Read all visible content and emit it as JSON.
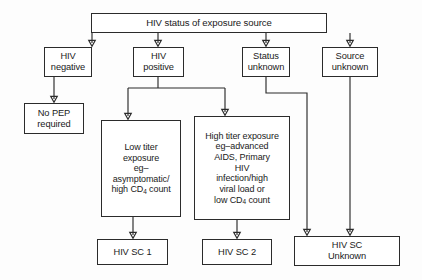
{
  "diagram": {
    "title": "HIV status of exposure source",
    "type": "flowchart",
    "root": {
      "id": "root",
      "label": "HIV status of exposure source",
      "x": 91,
      "y": 13,
      "w": 236,
      "h": 20,
      "font": 9.6
    },
    "level2": [
      {
        "id": "hiv-negative",
        "label": "HIV\nnegative",
        "x": 44,
        "y": 47,
        "w": 48,
        "h": 30,
        "font": 9.3
      },
      {
        "id": "hiv-positive",
        "label": "HIV\npositive",
        "x": 133,
        "y": 47,
        "w": 51,
        "h": 30,
        "font": 9.3
      },
      {
        "id": "status-unknown",
        "label": "Status\nunknown",
        "x": 242,
        "y": 47,
        "w": 48,
        "h": 30,
        "font": 9.3
      },
      {
        "id": "source-unknown",
        "label": "Source\nunknown",
        "x": 322,
        "y": 47,
        "w": 56,
        "h": 30,
        "font": 9.3
      }
    ],
    "level3": [
      {
        "id": "no-pep-required",
        "label": "No PEP\nrequired",
        "x": 24,
        "y": 103,
        "w": 60,
        "h": 31,
        "font": 9.3
      },
      {
        "id": "low-titer-exposure",
        "lines": [
          "Low titer",
          "exposure",
          "eg–",
          "asymptomatic/",
          "high CD<sub>4</sub> count"
        ],
        "x": 101,
        "y": 120,
        "w": 80,
        "h": 97,
        "font": 9.0
      },
      {
        "id": "high-titer-exposure",
        "lines": [
          "High titer exposure",
          "eg–advanced",
          "AIDS, Primary",
          "HIV",
          "infection/high",
          "viral load or",
          "low CD<sub>4</sub> count"
        ],
        "x": 194,
        "y": 116,
        "w": 96,
        "h": 104,
        "font": 9.0
      }
    ],
    "level4": [
      {
        "id": "hiv-sc-1",
        "label": "HIV SC 1",
        "x": 97,
        "y": 239,
        "w": 71,
        "h": 26,
        "font": 9.3
      },
      {
        "id": "hiv-sc-2",
        "label": "HIV SC 2",
        "x": 202,
        "y": 239,
        "w": 70,
        "h": 26,
        "font": 9.3
      },
      {
        "id": "hiv-sc-unknown",
        "label": "HIV SC\nUnknown",
        "x": 294,
        "y": 236,
        "w": 106,
        "h": 30,
        "font": 9.3
      }
    ],
    "connectors": [
      {
        "id": "root-to-hiv-negative",
        "d": "M 92,33 L 92,43"
      },
      {
        "id": "root-to-hiv-positive",
        "d": "M 158,33 L 158,43"
      },
      {
        "id": "root-to-status-unknown",
        "d": "M 266,33 L 266,43"
      },
      {
        "id": "root-to-source-unknown",
        "d": "M 350,33 L 350,43"
      },
      {
        "id": "hiv-negative-to-no-pep",
        "d": "M 54,77 L 54,99"
      },
      {
        "id": "hiv-positive-split-stem",
        "d": "M 158,77 L 158,88"
      },
      {
        "id": "hiv-positive-split-bar",
        "d": "M 128,88 L 225,88"
      },
      {
        "id": "hiv-positive-to-low-titer",
        "d": "M 128,88 L 128,116"
      },
      {
        "id": "hiv-positive-to-high-titer",
        "d": "M 225,88 L 225,112"
      },
      {
        "id": "status-unknown-elbow",
        "d": "M 266,77 L 266,93 L 307,93 L 307,232"
      },
      {
        "id": "source-unknown-to-hiv-sc-unknown",
        "d": "M 350,77 L 350,232"
      },
      {
        "id": "low-titer-to-hiv-sc-1",
        "d": "M 133,217 L 133,235"
      },
      {
        "id": "high-titer-to-hiv-sc-2",
        "d": "M 237,220 L 237,235"
      }
    ],
    "arrowheads": [
      {
        "id": "arrow-hiv-negative",
        "x": 92,
        "y": 45
      },
      {
        "id": "arrow-hiv-positive",
        "x": 158,
        "y": 45
      },
      {
        "id": "arrow-status-unknown",
        "x": 266,
        "y": 45
      },
      {
        "id": "arrow-source-unknown",
        "x": 350,
        "y": 45
      },
      {
        "id": "arrow-no-pep",
        "x": 54,
        "y": 101
      },
      {
        "id": "arrow-low-titer",
        "x": 128,
        "y": 118
      },
      {
        "id": "arrow-high-titer",
        "x": 225,
        "y": 114
      },
      {
        "id": "arrow-hiv-sc-1",
        "x": 133,
        "y": 237
      },
      {
        "id": "arrow-hiv-sc-2",
        "x": 237,
        "y": 237
      },
      {
        "id": "arrow-hiv-sc-unknown-a",
        "x": 307,
        "y": 234
      },
      {
        "id": "arrow-hiv-sc-unknown-b",
        "x": 350,
        "y": 234
      }
    ],
    "colors": {
      "stroke": "#2b2b2b",
      "text": "#1a1a1a",
      "background": "#fdfdfd",
      "node_fill": "#ffffff"
    }
  }
}
